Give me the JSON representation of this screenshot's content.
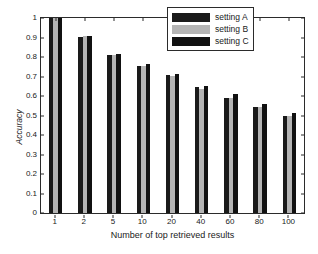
{
  "chart_data": {
    "type": "bar",
    "title": "",
    "xlabel": "Number of top retrieved results",
    "ylabel": "Accuracy",
    "categories": [
      "1",
      "2",
      "5",
      "10",
      "20",
      "40",
      "60",
      "80",
      "100"
    ],
    "series": [
      {
        "name": "setting A",
        "color": "#1a1a1a",
        "values": [
          1.0,
          0.905,
          0.81,
          0.755,
          0.71,
          0.645,
          0.59,
          0.545,
          0.498
        ]
      },
      {
        "name": "setting B",
        "color": "#b4b4b4",
        "values": [
          1.0,
          0.91,
          0.81,
          0.755,
          0.705,
          0.638,
          0.59,
          0.543,
          0.5
        ]
      },
      {
        "name": "setting C",
        "color": "#111111",
        "values": [
          1.0,
          0.908,
          0.815,
          0.762,
          0.712,
          0.65,
          0.61,
          0.558,
          0.512
        ]
      }
    ],
    "ylim": [
      0,
      1
    ],
    "yticks": [
      "0",
      "0.1",
      "0.2",
      "0.3",
      "0.4",
      "0.5",
      "0.6",
      "0.7",
      "0.8",
      "0.9",
      "1"
    ],
    "ytick_values": [
      0,
      0.1,
      0.2,
      0.3,
      0.4,
      0.5,
      0.6,
      0.7,
      0.8,
      0.9,
      1
    ],
    "grid": false,
    "legend_position": "top-right",
    "legend_entries": [
      "setting A",
      "setting B",
      "setting C"
    ],
    "axis_color": "#2b2b2b",
    "background_color": "#ffffff"
  }
}
